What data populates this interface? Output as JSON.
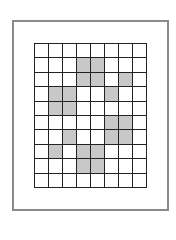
{
  "figure": {
    "rows": 10,
    "cols": 8,
    "frame_color": "#8a8a8a",
    "line_color": "#222222",
    "fill_color": "#ffffff",
    "shade_color": "#c8c8c8",
    "shaded_cells": [
      [
        1,
        3
      ],
      [
        1,
        4
      ],
      [
        2,
        3
      ],
      [
        2,
        4
      ],
      [
        2,
        6
      ],
      [
        3,
        1
      ],
      [
        3,
        2
      ],
      [
        3,
        5
      ],
      [
        4,
        1
      ],
      [
        4,
        2
      ],
      [
        5,
        5
      ],
      [
        5,
        6
      ],
      [
        6,
        2
      ],
      [
        6,
        5
      ],
      [
        6,
        6
      ],
      [
        7,
        1
      ],
      [
        7,
        3
      ],
      [
        7,
        4
      ],
      [
        8,
        3
      ],
      [
        8,
        4
      ]
    ]
  }
}
